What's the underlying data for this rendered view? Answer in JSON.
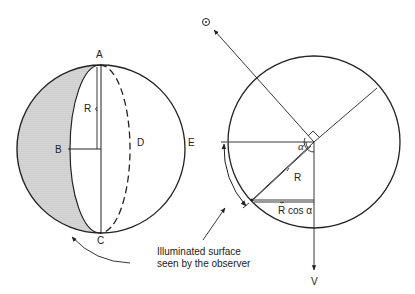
{
  "left_sphere": {
    "labels": {
      "top": "A",
      "bottom": "C",
      "left": "B",
      "dashed": "D",
      "right": "E",
      "radius": "R"
    }
  },
  "right_circle": {
    "sun_symbol": "⊙",
    "velocity_label": "V",
    "angle_label": "α",
    "radius_label": "R",
    "projection_label": "R cos α"
  },
  "caption": {
    "line1": "Illuminated surface",
    "line2": "seen by the observer"
  },
  "colors": {
    "stroke": "#222222",
    "shading": "#c8c8c8",
    "background": "#ffffff"
  }
}
